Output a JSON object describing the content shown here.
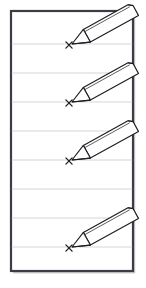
{
  "figure": {
    "title": "Ruled paper sheet with four pencils marking X points",
    "caption": "",
    "background_color": "#ffffff"
  },
  "sheet": {
    "name": "ruled-paper-sheet",
    "x": 11,
    "y": 11,
    "width": 122,
    "height": 260,
    "fill_color": "#ffffff",
    "border_color": "#3c3c46",
    "border_width": 2.2,
    "shadow_color": "#9a9aa2"
  },
  "ruled_lines": {
    "name": "ruled-lines",
    "color": "#d5d5da",
    "width": 1.1,
    "count": 8,
    "y_positions": [
      44,
      73,
      102,
      131,
      160,
      189,
      218,
      247
    ]
  },
  "pencils": [
    {
      "name": "pencil-1",
      "index": 1,
      "tip_x": 72,
      "tip_y": 44,
      "angle_deg": -29,
      "length": 72,
      "half_width": 7.2,
      "ferrule_at": 17,
      "outline_color": "#1d1d22",
      "body_color": "#ffffff",
      "lead_color": "#1d1d22",
      "mark": {
        "name": "x-mark-1",
        "label": "x",
        "x": 69,
        "y": 45,
        "size": 6.2,
        "color": "#1d1d22",
        "stroke_width": 1.3
      }
    },
    {
      "name": "pencil-2",
      "index": 2,
      "tip_x": 72,
      "tip_y": 102,
      "angle_deg": -29,
      "length": 72,
      "half_width": 7.2,
      "ferrule_at": 17,
      "outline_color": "#1d1d22",
      "body_color": "#ffffff",
      "lead_color": "#1d1d22",
      "mark": {
        "name": "x-mark-2",
        "label": "x",
        "x": 69,
        "y": 103,
        "size": 6.2,
        "color": "#1d1d22",
        "stroke_width": 1.3
      }
    },
    {
      "name": "pencil-3",
      "index": 3,
      "tip_x": 72,
      "tip_y": 160,
      "angle_deg": -29,
      "length": 72,
      "half_width": 7.2,
      "ferrule_at": 17,
      "outline_color": "#1d1d22",
      "body_color": "#ffffff",
      "lead_color": "#1d1d22",
      "mark": {
        "name": "x-mark-3",
        "label": "x",
        "x": 69,
        "y": 161,
        "size": 6.2,
        "color": "#1d1d22",
        "stroke_width": 1.3
      }
    },
    {
      "name": "pencil-4",
      "index": 4,
      "tip_x": 72,
      "tip_y": 247,
      "angle_deg": -29,
      "length": 72,
      "half_width": 7.2,
      "ferrule_at": 17,
      "outline_color": "#1d1d22",
      "body_color": "#ffffff",
      "lead_color": "#1d1d22",
      "mark": {
        "name": "x-mark-4",
        "label": "x",
        "x": 69,
        "y": 248,
        "size": 6.2,
        "color": "#1d1d22",
        "stroke_width": 1.3
      }
    }
  ]
}
